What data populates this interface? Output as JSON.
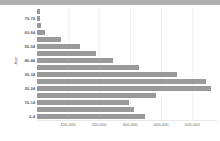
{
  "chart_data": {
    "type": "bar",
    "orientation": "horizontal",
    "title": "",
    "xlabel": "",
    "ylabel": "Age",
    "grid": true,
    "legend": null,
    "xlim": [
      0,
      580000
    ],
    "xticks": [
      100000,
      200000,
      300000,
      400000,
      500000
    ],
    "xtick_labels": [
      "100,000",
      "200,000",
      "300,000",
      "400,000",
      "500,000"
    ],
    "categories": [
      "75+",
      "70-74",
      "65-69",
      "60-64",
      "55-59",
      "50-54",
      "45-49",
      "40-44",
      "35-39",
      "30-34",
      "25-29",
      "20-24",
      "15-19",
      "10-14",
      "5-9",
      "0-4"
    ],
    "values": [
      9000,
      11000,
      14000,
      27000,
      78000,
      139000,
      190000,
      244000,
      330000,
      452000,
      543000,
      560000,
      382000,
      296000,
      312000,
      348000
    ],
    "ytick_labels_shown": [
      "70-74",
      "60-64",
      "50-54",
      "40-44",
      "30-34",
      "20-24",
      "10-14",
      "0-4"
    ],
    "bar_color": "#9a9a9a",
    "grid_color": "#f2f2f2",
    "axis_text_color": "#6e6e6e"
  },
  "topbar": {
    "color": "#b0b0b0"
  }
}
